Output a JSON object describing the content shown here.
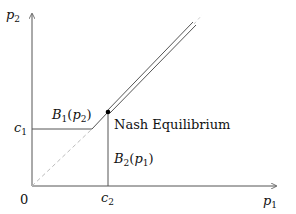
{
  "diagram": {
    "type": "best-response diagram",
    "axes": {
      "x_label": {
        "var": "p",
        "sub": "1"
      },
      "y_label": {
        "var": "p",
        "sub": "2"
      },
      "origin_label": "0"
    },
    "ticks": {
      "c1": {
        "var": "c",
        "sub": "1"
      },
      "c2": {
        "var": "c",
        "sub": "2"
      }
    },
    "curves": {
      "b1": {
        "name": "B",
        "sub": "1",
        "arg": "p",
        "arg_sub": "2"
      },
      "b2": {
        "name": "B",
        "sub": "2",
        "arg": "p",
        "arg_sub": "1"
      }
    },
    "annotation": "Nash Equilibrium",
    "colors": {
      "line": "#555555",
      "dashed": "#bbbbbb",
      "point": "#000000"
    }
  }
}
